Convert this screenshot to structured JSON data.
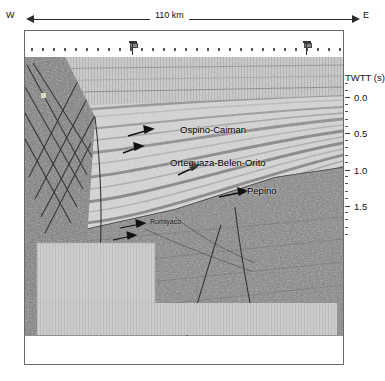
{
  "figure": {
    "type": "seismic-reflection-profile",
    "orientation_left": "W",
    "orientation_right": "E",
    "scale_label": "110 km"
  },
  "axis": {
    "title": "TWTT (s)",
    "ticks": [
      {
        "label": "0.0",
        "value": 0.0,
        "y": 40
      },
      {
        "label": "0.5",
        "value": 0.5,
        "y": 76
      },
      {
        "label": "1.0",
        "value": 1.0,
        "y": 113
      },
      {
        "label": "1.5",
        "value": 1.5,
        "y": 149
      }
    ],
    "minor_tick_step": 0.1,
    "units": "s"
  },
  "annotations": [
    {
      "name": "ospino-caiman",
      "text": "Ospino-Caiman",
      "x": 158,
      "y": 131,
      "arrow": {
        "x1": 128,
        "y1": 135,
        "x2": 150,
        "y2": 129
      }
    },
    {
      "name": "orteguaza-belen-orito",
      "text": "Orteguaza-Belen-Orito",
      "x": 145,
      "y": 164,
      "arrow": {
        "x1": 178,
        "y1": 175,
        "x2": 196,
        "y2": 168
      }
    },
    {
      "name": "pepino",
      "text": "Pepino",
      "x": 249,
      "y": 192,
      "arrow": {
        "x1": 219,
        "y1": 198,
        "x2": 243,
        "y2": 192
      }
    },
    {
      "name": "rumiyaco",
      "text": "Rumiyaco",
      "x": 152,
      "y": 224,
      "arrow": {
        "x1": 120,
        "y1": 229,
        "x2": 144,
        "y2": 225
      }
    },
    {
      "name": "unnamed-reflector",
      "text": "",
      "x": 0,
      "y": 0,
      "arrow": {
        "x1": 123,
        "y1": 152,
        "x2": 140,
        "y2": 147
      }
    }
  ],
  "wells": [
    {
      "name": "well-marker-1",
      "x": 133
    },
    {
      "name": "well-marker-2",
      "x": 307
    }
  ],
  "colors": {
    "frame": "#6a6a6a",
    "arrow": "#2b2b2b",
    "text": "#111111",
    "sediment_light": "#cfcfcf",
    "basement_dark": "#6b6b6b",
    "fault": "#3a3a3a"
  }
}
